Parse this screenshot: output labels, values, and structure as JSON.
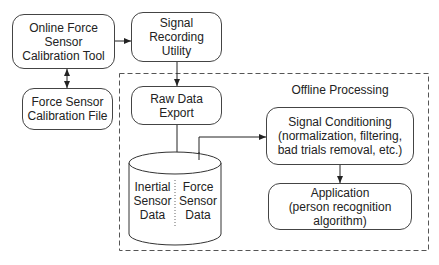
{
  "diagram": {
    "nodes": {
      "calibration_tool": {
        "lines": [
          "Online Force",
          "Sensor",
          "Calibration Tool"
        ]
      },
      "signal_recording": {
        "lines": [
          "Signal",
          "Recording",
          "Utility"
        ]
      },
      "calibration_file": {
        "lines": [
          "Force Sensor",
          "Calibration File"
        ]
      },
      "raw_data_export": {
        "lines": [
          "Raw Data",
          "Export"
        ]
      },
      "database": {
        "left": [
          "Inertial",
          "Sensor",
          "Data"
        ],
        "right": [
          "Force",
          "Sensor",
          "Data"
        ]
      },
      "signal_conditioning": {
        "lines": [
          "Signal Conditioning",
          "(normalization, filtering,",
          "bad trials removal, etc.)"
        ]
      },
      "application": {
        "lines": [
          "Application",
          "(person recognition",
          "algorithm)"
        ]
      }
    },
    "group": {
      "label": "Offline Processing"
    },
    "edges": [
      {
        "from": "calibration_tool",
        "to": "signal_recording",
        "type": "arrow"
      },
      {
        "from": "calibration_tool",
        "to": "calibration_file",
        "type": "bidirectional"
      },
      {
        "from": "signal_recording",
        "to": "raw_data_export",
        "type": "arrow"
      },
      {
        "from": "raw_data_export",
        "to": "database",
        "type": "arrow"
      },
      {
        "from": "database",
        "to": "signal_conditioning",
        "type": "arrow"
      },
      {
        "from": "signal_conditioning",
        "to": "application",
        "type": "arrow"
      }
    ]
  }
}
